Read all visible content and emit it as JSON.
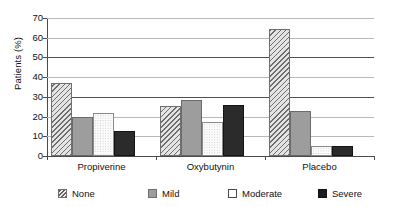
{
  "chart_data": {
    "type": "bar",
    "title": "",
    "subtitle": "",
    "xlabel": "",
    "ylabel": "Patients (%)",
    "ylim": [
      0,
      70
    ],
    "ytick_step": 10,
    "yticks": [
      70,
      60,
      50,
      40,
      30,
      20,
      10,
      0
    ],
    "grid": true,
    "grid_axis": "y",
    "legend_position": "bottom",
    "categories": [
      "Propiverine",
      "Oxybutynin",
      "Placebo"
    ],
    "series": [
      {
        "name": "None",
        "pattern": "diagonal-hatch",
        "color": "#e4e4e4",
        "values": [
          37,
          25.5,
          64.5
        ]
      },
      {
        "name": "Mild",
        "pattern": "solid-gray",
        "color": "#9d9d9d",
        "values": [
          20,
          28.5,
          23
        ]
      },
      {
        "name": "Moderate",
        "pattern": "white-dotted",
        "color": "#fbfbfb",
        "values": [
          22,
          17.5,
          5
        ]
      },
      {
        "name": "Severe",
        "pattern": "solid-black",
        "color": "#2b2b2b",
        "values": [
          12.5,
          26,
          5
        ]
      }
    ]
  },
  "legend": {
    "items": [
      {
        "label": "None"
      },
      {
        "label": "Mild"
      },
      {
        "label": "Moderate"
      },
      {
        "label": "Severe"
      }
    ]
  },
  "axis": {
    "y_title": "Patients (%)"
  }
}
